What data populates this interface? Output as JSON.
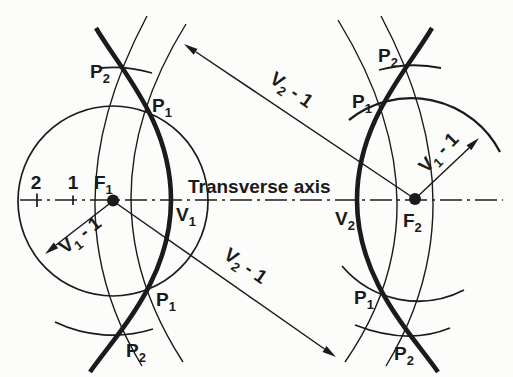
{
  "colors": {
    "ink": "#1b1b1b",
    "paper": "#fcfcfa"
  },
  "axis": {
    "label": "Transverse axis"
  },
  "scale_marks": {
    "mark_2": "2",
    "mark_1": "1"
  },
  "points": {
    "f1": {
      "base": "F",
      "sub": "1"
    },
    "f2": {
      "base": "F",
      "sub": "2"
    },
    "v1": {
      "base": "V",
      "sub": "1"
    },
    "v2": {
      "base": "V",
      "sub": "2"
    },
    "p1": {
      "base": "P",
      "sub": "1"
    },
    "p2": {
      "base": "P",
      "sub": "2"
    }
  },
  "radius_labels": {
    "v2_minus_1": {
      "base": "V",
      "sub": "2",
      "rest": " - 1"
    },
    "v1_minus_1": {
      "base": "V",
      "sub": "1",
      "rest": " - 1"
    }
  }
}
